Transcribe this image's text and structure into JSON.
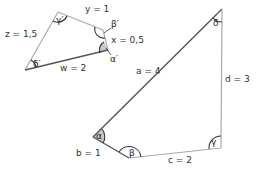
{
  "colors": {
    "dark_edge": "#555555",
    "light_edge": "#aaaaaa",
    "shade": "#c8c8c8",
    "arc": "#333333"
  },
  "small_quad": {
    "sides": {
      "y": "y = 1",
      "x": "x = 0,5",
      "w": "w = 2",
      "z": "z = 1,5"
    },
    "angles": {
      "alpha": "α′",
      "beta": "β′",
      "gamma": "γ′",
      "delta": "δ′"
    }
  },
  "large_quad": {
    "sides": {
      "a": "a = 4",
      "b": "b = 1",
      "c": "c = 2",
      "d": "d = 3"
    },
    "angles": {
      "alpha": "α",
      "beta": "β",
      "gamma": "γ",
      "delta": "δ"
    }
  }
}
